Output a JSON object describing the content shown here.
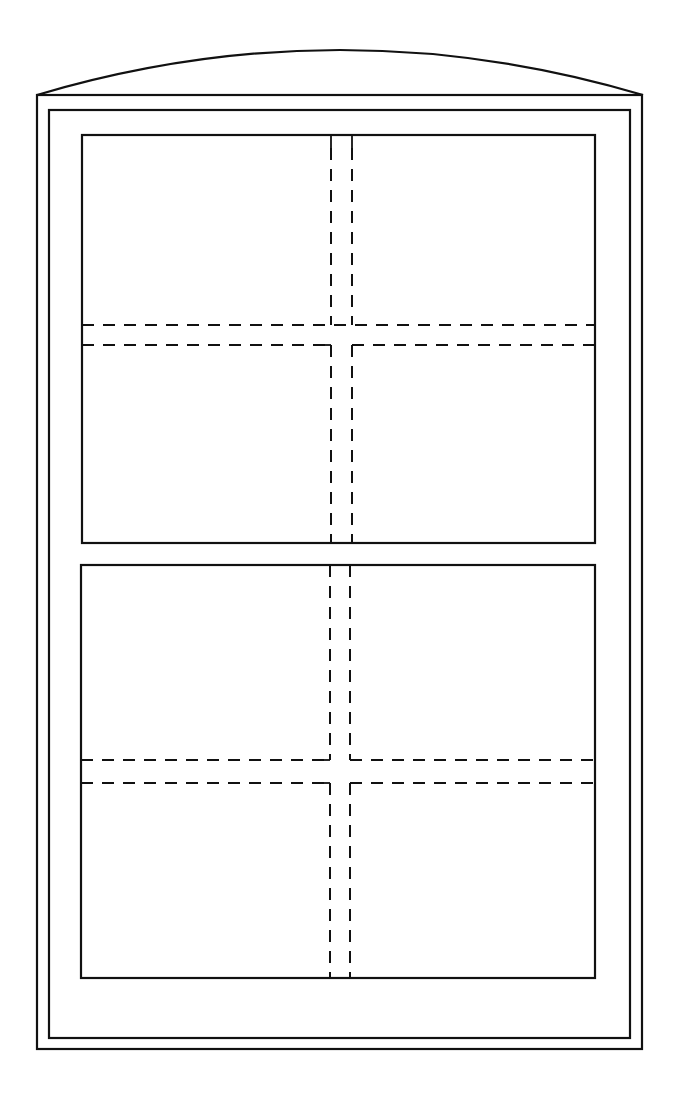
{
  "diagram": {
    "colors": {
      "line": "#111111",
      "background": "#ffffff"
    },
    "arch_head": {
      "left": [
        37,
        95
      ],
      "apex": [
        340,
        48
      ],
      "right": [
        643,
        95
      ]
    },
    "outer_frame": {
      "x": 37,
      "y": 95,
      "w": 605,
      "h": 954
    },
    "inner_frame": {
      "x": 49,
      "y": 110,
      "w": 581,
      "h": 928
    },
    "upper_sash": {
      "x": 82,
      "y": 135,
      "w": 513,
      "h": 408,
      "vertical_muntin_x": [
        331,
        352
      ],
      "horizontal_muntin_y": [
        325,
        345
      ]
    },
    "lower_sash": {
      "x": 81,
      "y": 565,
      "w": 514,
      "h": 413,
      "vertical_muntin_x": [
        330,
        350
      ],
      "horizontal_muntin_y": [
        760,
        783
      ]
    }
  }
}
